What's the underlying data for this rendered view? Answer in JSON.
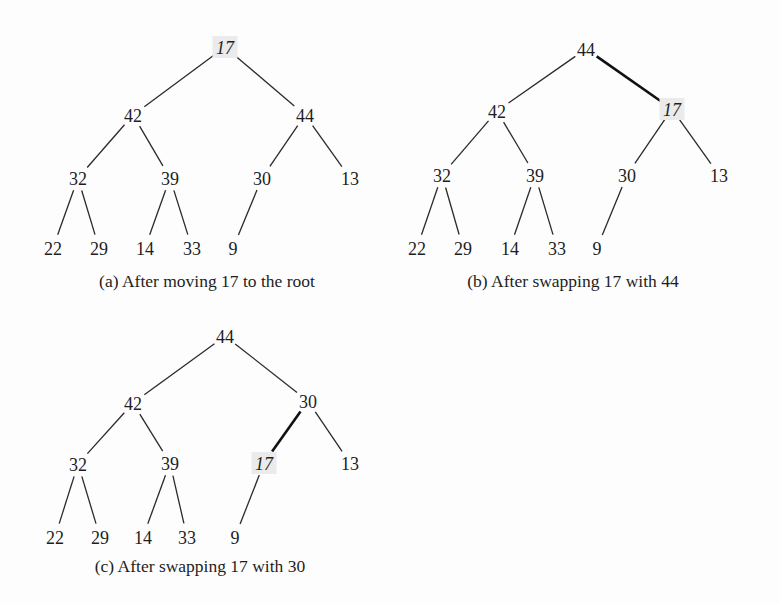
{
  "figure": {
    "highlight_color": "#ebebeb",
    "text_color": "#1e1e1e",
    "panels": [
      {
        "id": "a",
        "caption": "(a) After moving 17 to the root",
        "caption_pos": [
          207,
          287
        ],
        "highlight_node": "n0",
        "thick_edges": [],
        "nodes": [
          {
            "id": "n0",
            "label": "17",
            "x": 225,
            "y": 47
          },
          {
            "id": "n1",
            "label": "42",
            "x": 133,
            "y": 115
          },
          {
            "id": "n2",
            "label": "44",
            "x": 305,
            "y": 115
          },
          {
            "id": "n3",
            "label": "32",
            "x": 78,
            "y": 178
          },
          {
            "id": "n4",
            "label": "39",
            "x": 170,
            "y": 178
          },
          {
            "id": "n5",
            "label": "30",
            "x": 262,
            "y": 178
          },
          {
            "id": "n6",
            "label": "13",
            "x": 350,
            "y": 178
          },
          {
            "id": "n7",
            "label": "22",
            "x": 53,
            "y": 248
          },
          {
            "id": "n8",
            "label": "29",
            "x": 99,
            "y": 248
          },
          {
            "id": "n9",
            "label": "14",
            "x": 145,
            "y": 248
          },
          {
            "id": "n10",
            "label": "33",
            "x": 192,
            "y": 248
          },
          {
            "id": "n11",
            "label": "9",
            "x": 233,
            "y": 248
          }
        ]
      },
      {
        "id": "b",
        "caption": "(b) After swapping 17 with 44",
        "caption_pos": [
          573,
          287
        ],
        "highlight_node": "n2",
        "thick_edges": [
          [
            "n0",
            "n2"
          ]
        ],
        "nodes": [
          {
            "id": "n0",
            "label": "44",
            "x": 586,
            "y": 49
          },
          {
            "id": "n1",
            "label": "42",
            "x": 497,
            "y": 111
          },
          {
            "id": "n2",
            "label": "17",
            "x": 672,
            "y": 109
          },
          {
            "id": "n3",
            "label": "32",
            "x": 442,
            "y": 175
          },
          {
            "id": "n4",
            "label": "39",
            "x": 535,
            "y": 175
          },
          {
            "id": "n5",
            "label": "30",
            "x": 627,
            "y": 175
          },
          {
            "id": "n6",
            "label": "13",
            "x": 719,
            "y": 175
          },
          {
            "id": "n7",
            "label": "22",
            "x": 417,
            "y": 248
          },
          {
            "id": "n8",
            "label": "29",
            "x": 463,
            "y": 248
          },
          {
            "id": "n9",
            "label": "14",
            "x": 510,
            "y": 248
          },
          {
            "id": "n10",
            "label": "33",
            "x": 557,
            "y": 248
          },
          {
            "id": "n11",
            "label": "9",
            "x": 597,
            "y": 248
          }
        ]
      },
      {
        "id": "c",
        "caption": "(c) After swapping 17 with 30",
        "caption_pos": [
          200,
          572
        ],
        "highlight_node": "n5",
        "thick_edges": [
          [
            "n2",
            "n5"
          ]
        ],
        "nodes": [
          {
            "id": "n0",
            "label": "44",
            "x": 225,
            "y": 336
          },
          {
            "id": "n1",
            "label": "42",
            "x": 133,
            "y": 403
          },
          {
            "id": "n2",
            "label": "30",
            "x": 308,
            "y": 401
          },
          {
            "id": "n3",
            "label": "32",
            "x": 78,
            "y": 464
          },
          {
            "id": "n4",
            "label": "39",
            "x": 170,
            "y": 463
          },
          {
            "id": "n5",
            "label": "17",
            "x": 264,
            "y": 463
          },
          {
            "id": "n6",
            "label": "13",
            "x": 350,
            "y": 463
          },
          {
            "id": "n7",
            "label": "22",
            "x": 55,
            "y": 537
          },
          {
            "id": "n8",
            "label": "29",
            "x": 100,
            "y": 537
          },
          {
            "id": "n9",
            "label": "14",
            "x": 143,
            "y": 537
          },
          {
            "id": "n10",
            "label": "33",
            "x": 187,
            "y": 537
          },
          {
            "id": "n11",
            "label": "9",
            "x": 235,
            "y": 537
          }
        ]
      }
    ],
    "tree_edges": [
      [
        "n0",
        "n1"
      ],
      [
        "n0",
        "n2"
      ],
      [
        "n1",
        "n3"
      ],
      [
        "n1",
        "n4"
      ],
      [
        "n2",
        "n5"
      ],
      [
        "n2",
        "n6"
      ],
      [
        "n3",
        "n7"
      ],
      [
        "n3",
        "n8"
      ],
      [
        "n4",
        "n9"
      ],
      [
        "n4",
        "n10"
      ],
      [
        "n5",
        "n11"
      ]
    ]
  }
}
